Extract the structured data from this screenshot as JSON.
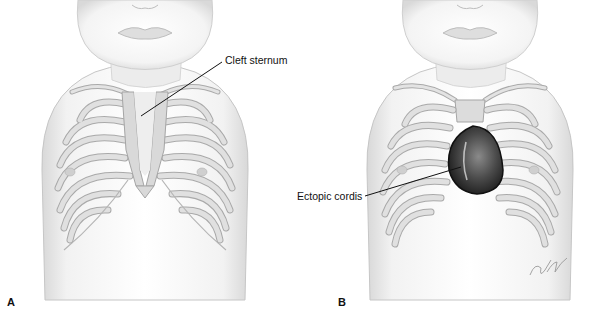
{
  "figure": {
    "panels": [
      {
        "letter": "A",
        "annotation": "Cleft sternum",
        "description": "Infant chest showing cleft sternum"
      },
      {
        "letter": "B",
        "annotation": "Ectopic cordis",
        "description": "Infant chest showing heart outside thoracic cavity"
      }
    ],
    "signature": "©JW",
    "colors": {
      "background": "#ffffff",
      "skin_shade": "#e2e2e2",
      "rib_fill": "#dcdcdc",
      "rib_stroke": "#a8a8a8",
      "heart_dark": "#2b2b2b",
      "heart_mid": "#6a6a6a",
      "leader_line": "#111111"
    }
  }
}
